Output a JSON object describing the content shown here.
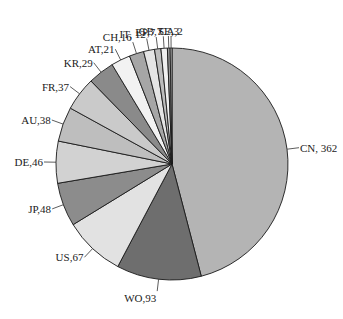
{
  "chart_data": {
    "type": "pie",
    "title": "",
    "categories": [
      "CN",
      "WO",
      "US",
      "JP",
      "DE",
      "AU",
      "FR",
      "KR",
      "AT",
      "CH",
      "IT",
      "EP",
      "GB",
      "SE",
      "CA"
    ],
    "values": [
      362,
      93,
      67,
      48,
      46,
      38,
      37,
      29,
      21,
      16,
      12,
      7,
      7,
      3,
      2
    ],
    "labels": [
      "CN, 362",
      "WO,93",
      "US,67",
      "JP,48",
      "DE,46",
      "AU,38",
      "FR,37",
      "KR,29",
      "AT,21",
      "CH,16",
      "IT, 12",
      "EP,7",
      "GB,7",
      "SE,3",
      "CA,2"
    ],
    "colors": [
      "#b4b4b4",
      "#6e6e6e",
      "#e2e2e2",
      "#8c8c8c",
      "#d2d2d2",
      "#bebebe",
      "#cacaca",
      "#8a8a8a",
      "#f2f2f2",
      "#a6a6a6",
      "#e4e4e4",
      "#bdbdbd",
      "#f0f0f0",
      "#9a9a9a",
      "#cfcfcf"
    ],
    "start_angle_deg": 0,
    "direction": "clockwise",
    "legend": "none (leader-line labels)"
  }
}
